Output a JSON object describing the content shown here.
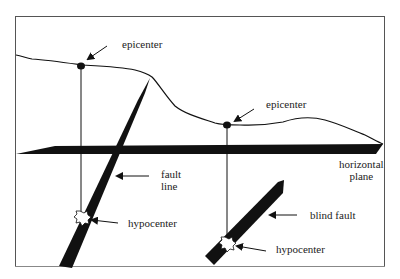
{
  "diagram": {
    "title": "",
    "labels": {
      "epicenter_1": "epicenter",
      "epicenter_2": "epicenter",
      "fault_line_1": "fault",
      "fault_line_2": "line",
      "hypocenter_1": "hypocenter",
      "hypocenter_2": "hypocenter",
      "horizontal_plane_1": "horizontal",
      "horizontal_plane_2": "plane",
      "blind_fault": "blind fault"
    },
    "colors": {
      "ink": "#111111",
      "frame": "#555555",
      "background": "#ffffff"
    }
  }
}
